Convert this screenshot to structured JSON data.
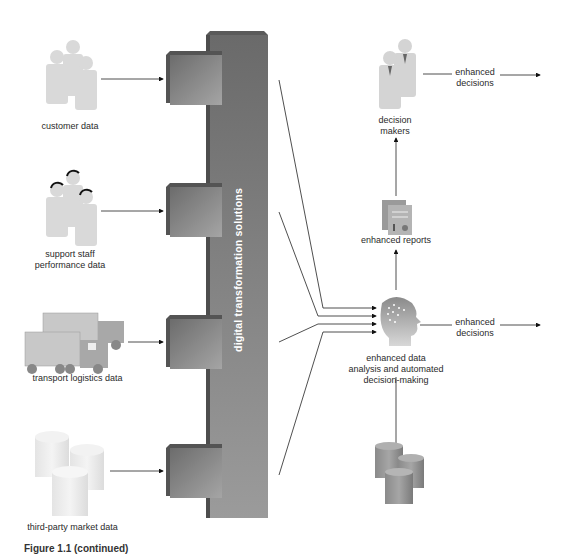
{
  "diagram": {
    "central_column": {
      "label": "digital transformation solutions",
      "color": "#6f6f6f"
    },
    "inputs": [
      {
        "label": "customer data",
        "icon": "people-icon"
      },
      {
        "label": "support staff performance data",
        "label_lines": [
          "support staff",
          "performance data"
        ],
        "icon": "headset-people-icon"
      },
      {
        "label": "transport logistics data",
        "icon": "trucks-icon"
      },
      {
        "label": "third-party market data",
        "icon": "database-icon"
      }
    ],
    "processor": {
      "label_lines": [
        "enhanced data",
        "analysis and automated",
        "decision-making"
      ],
      "icon": "brain-head-icon"
    },
    "reports": {
      "label": "enhanced reports",
      "icon": "reports-icon"
    },
    "decision_makers": {
      "label_lines": [
        "decision",
        "makers"
      ],
      "icon": "business-people-icon"
    },
    "outputs": [
      {
        "label_lines": [
          "enhanced",
          "decisions"
        ],
        "from": "decision makers"
      },
      {
        "label_lines": [
          "enhanced",
          "decisions"
        ],
        "from": "enhanced data analysis"
      }
    ],
    "storage": {
      "icon": "database-icon"
    },
    "caption": "Figure 1.1 (continued)"
  }
}
